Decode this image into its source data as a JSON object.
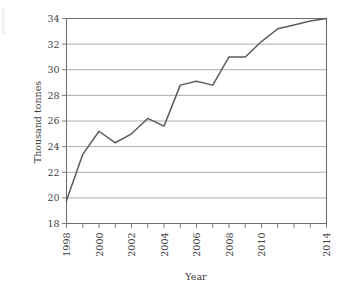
{
  "chart_data": {
    "type": "line",
    "title": "",
    "xlabel": "Year",
    "ylabel": "Thousand tonnes",
    "xlim": [
      1998,
      2014
    ],
    "ylim": [
      18,
      34
    ],
    "grid": true,
    "legend": "none",
    "y_ticks": [
      18,
      20,
      22,
      24,
      26,
      28,
      30,
      32,
      34
    ],
    "y_tick_labels": [
      "18",
      "20",
      "22",
      "24",
      "26",
      "28",
      "30",
      "32",
      "34"
    ],
    "x_ticks": [
      1998,
      1999,
      2000,
      2001,
      2002,
      2003,
      2004,
      2005,
      2006,
      2007,
      2008,
      2009,
      2010,
      2011,
      2012,
      2013,
      2014
    ],
    "x_tick_labels": [
      "1998",
      "",
      "2000",
      "",
      "2002",
      "",
      "2004",
      "",
      "2006",
      "",
      "2008",
      "",
      "2010",
      "",
      "",
      "",
      "2014"
    ],
    "x_labeled_ticks": [
      "1998",
      "2000",
      "2002",
      "2004",
      "2006",
      "2008",
      "2010",
      "2014"
    ],
    "series": [
      {
        "name": "Production",
        "color": "#5c5c5c",
        "x": [
          1998,
          1999,
          2000,
          2001,
          2002,
          2003,
          2004,
          2005,
          2006,
          2007,
          2008,
          2009,
          2010,
          2011,
          2012,
          2013,
          2014
        ],
        "values": [
          19.8,
          23.4,
          25.2,
          24.3,
          25.0,
          26.2,
          25.6,
          28.8,
          29.1,
          28.8,
          31.0,
          31.0,
          32.2,
          33.2,
          33.5,
          33.8,
          34.0
        ]
      }
    ]
  },
  "axes": {
    "y_axis_title": "Thousand tonnes",
    "x_axis_title": "Year"
  },
  "colors": {
    "line": "#5c5c5c",
    "grid": "#8a8a8a",
    "axis": "#6e6e6e",
    "text": "#3f3f3f",
    "background": "#ffffff"
  }
}
